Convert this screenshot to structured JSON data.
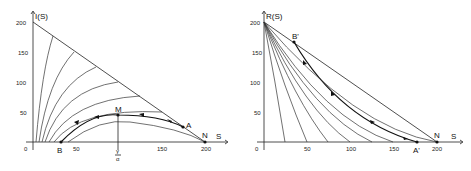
{
  "left_panel": {
    "y_axis_label": "I(S)",
    "x_axis_label": "S",
    "x_ticks": [
      "0",
      "50",
      "150",
      "200"
    ],
    "y_ticks": [
      "200",
      "150",
      "100",
      "50"
    ],
    "gamma_label_num": "γ",
    "gamma_label_den": "α",
    "points": {
      "M": "M",
      "A": "A",
      "N": "N",
      "B": "B"
    }
  },
  "right_panel": {
    "y_axis_label": "R(S)",
    "x_axis_label": "S",
    "x_ticks": [
      "0",
      "50",
      "100",
      "150",
      "200"
    ],
    "y_ticks": [
      "200",
      "150",
      "100",
      "50"
    ],
    "points": {
      "B_prime": "B'",
      "A_prime": "A'",
      "N": "N"
    }
  }
}
